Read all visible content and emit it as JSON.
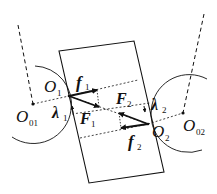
{
  "diagram": {
    "type": "force-diagram",
    "labels": {
      "O1": {
        "main": "O",
        "sub": "1"
      },
      "O2": {
        "main": "O",
        "sub": "2"
      },
      "O01": {
        "main": "O",
        "sub": "01"
      },
      "O02": {
        "main": "O",
        "sub": "02"
      },
      "f1": {
        "main": "f",
        "sub": "1"
      },
      "f2": {
        "main": "f",
        "sub": "2"
      },
      "F1": {
        "main": "F",
        "sub": "1"
      },
      "F2": {
        "main": "F",
        "sub": "2"
      },
      "lambda1": {
        "main": "λ",
        "sub": "1"
      },
      "lambda2": {
        "main": "λ",
        "sub": "2"
      }
    },
    "colors": {
      "line": "#111111",
      "background": "#ffffff"
    }
  }
}
